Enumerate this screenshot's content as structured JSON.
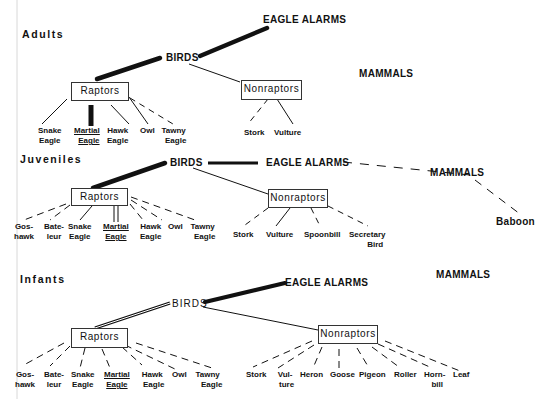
{
  "figure": {
    "vertical_rule_x": 17
  },
  "panels": [
    {
      "id": "adults",
      "section_label": "Adults",
      "birds": "BIRDS",
      "eagle_alarms": "EAGLE   ALARMS",
      "mammals": "MAMMALS",
      "raptors": "Raptors",
      "nonraptors": "Nonraptors",
      "raptor_leaves": [
        {
          "line1": "Snake",
          "line2": "Eagle",
          "link": "solid"
        },
        {
          "line1": "Martial",
          "line2": "Eagle",
          "link": "heavy",
          "underlined": true
        },
        {
          "line1": "Hawk",
          "line2": "Eagle",
          "link": "solid"
        },
        {
          "line1": "Owl",
          "line2": "",
          "link": "solid"
        },
        {
          "line1": "Tawny",
          "line2": "Eagle",
          "link": "dashed"
        }
      ],
      "nonraptor_leaves": [
        {
          "line1": "Stork",
          "line2": "",
          "link": "dashed"
        },
        {
          "line1": "Vulture",
          "line2": "",
          "link": "solid"
        }
      ]
    },
    {
      "id": "juveniles",
      "section_label": "Juveniles",
      "birds": "BIRDS",
      "eagle_alarms": "EAGLE   ALARMS",
      "mammals": "MAMMALS",
      "raptors": "Raptors",
      "nonraptors": "Nonraptors",
      "raptor_leaves": [
        {
          "line1": "Gos-",
          "line2": "hawk",
          "link": "dashed"
        },
        {
          "line1": "Bate-",
          "line2": "leur",
          "link": "dashed"
        },
        {
          "line1": "Snake",
          "line2": "Eagle",
          "link": "solid"
        },
        {
          "line1": "Martial",
          "line2": "Eagle",
          "link": "double",
          "underlined": true
        },
        {
          "line1": "Hawk",
          "line2": "Eagle",
          "link": "dashed"
        },
        {
          "line1": "Owl",
          "line2": "",
          "link": "dashed"
        },
        {
          "line1": "Tawny",
          "line2": "Eagle",
          "link": "dashed"
        }
      ],
      "nonraptor_leaves": [
        {
          "line1": "Stork",
          "line2": "",
          "link": "dashed"
        },
        {
          "line1": "Vulture",
          "line2": "",
          "link": "solid"
        },
        {
          "line1": "Spoonbill",
          "line2": "",
          "link": "dashed"
        },
        {
          "line1": "Secretary",
          "line2": "Bird",
          "link": "dashed"
        }
      ],
      "mammal_leaves": [
        {
          "line1": "Baboon",
          "line2": "",
          "link": "dashed"
        }
      ]
    },
    {
      "id": "infants",
      "section_label": "Infants",
      "birds": "BIRDS",
      "eagle_alarms": "EAGLE   ALARMS",
      "mammals": "MAMMALS",
      "raptors": "Raptors",
      "nonraptors": "Nonraptors",
      "raptor_leaves": [
        {
          "line1": "Gos-",
          "line2": "hawk",
          "link": "dashed"
        },
        {
          "line1": "Bate-",
          "line2": "leur",
          "link": "dashed"
        },
        {
          "line1": "Snake",
          "line2": "Eagle",
          "link": "dashed"
        },
        {
          "line1": "Martial",
          "line2": "Eagle",
          "link": "dashed",
          "underlined": true
        },
        {
          "line1": "Hawk",
          "line2": "Eagle",
          "link": "dashed"
        },
        {
          "line1": "Owl",
          "line2": "",
          "link": "dashed"
        },
        {
          "line1": "Tawny",
          "line2": "Eagle",
          "link": "dashed"
        }
      ],
      "nonraptor_leaves": [
        {
          "line1": "Stork",
          "line2": "",
          "link": "dashed"
        },
        {
          "line1": "Vul-",
          "line2": "ture",
          "link": "dashed"
        },
        {
          "line1": "Heron",
          "line2": "",
          "link": "dashed"
        },
        {
          "line1": "Goose",
          "line2": "",
          "link": "dashed"
        },
        {
          "line1": "Pigeon",
          "line2": "",
          "link": "dashed"
        },
        {
          "line1": "Roller",
          "line2": "",
          "link": "dashed"
        },
        {
          "line1": "Horn-",
          "line2": "bill",
          "link": "dashed"
        },
        {
          "line1": "Leaf",
          "line2": "",
          "link": "dashed"
        }
      ]
    }
  ],
  "legend_semantics": {
    "heavy_line": "strong association",
    "double_line": "moderate association",
    "thin_line": "weak association",
    "dashed_line": "rare/occasional alarm"
  },
  "colors": {
    "ink": "#111111",
    "rule": "#d0d0d0",
    "background": "#ffffff"
  }
}
